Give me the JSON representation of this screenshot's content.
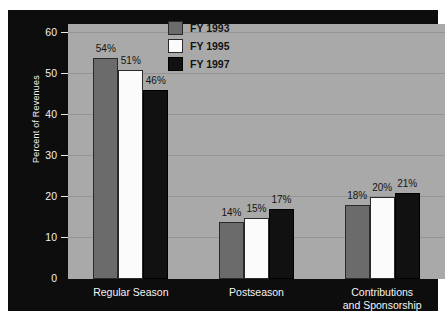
{
  "chart_data": {
    "type": "bar",
    "title": "",
    "xlabel": "",
    "ylabel": "Percent of Revenues",
    "ylim": [
      0,
      60
    ],
    "yticks": [
      0,
      10,
      20,
      30,
      40,
      50,
      60
    ],
    "ytick_labels": [
      "0",
      "10",
      "20",
      "30",
      "40",
      "50",
      "60"
    ],
    "grid": true,
    "legend_position": "top-center",
    "categories": [
      "Regular Season",
      "Postseason",
      "Contributions\nand Sponsorship"
    ],
    "series": [
      {
        "name": "FY 1993",
        "color": "#6b6b6b",
        "values": [
          54,
          14,
          18
        ],
        "data_labels": [
          "54%",
          "14%",
          "18%"
        ]
      },
      {
        "name": "FY 1995",
        "color": "#fbfbfb",
        "values": [
          51,
          15,
          20
        ],
        "data_labels": [
          "51%",
          "15%",
          "20%"
        ]
      },
      {
        "name": "FY 1997",
        "color": "#111111",
        "values": [
          46,
          17,
          21
        ],
        "data_labels": [
          "46%",
          "17%",
          "21%"
        ]
      }
    ]
  },
  "colors": {
    "frame_background": "#0d0d0d",
    "plot_background": "#a9a9a9",
    "gridline": "#949494",
    "axis_text": "#f2f2f2",
    "label_text": "#141414"
  }
}
